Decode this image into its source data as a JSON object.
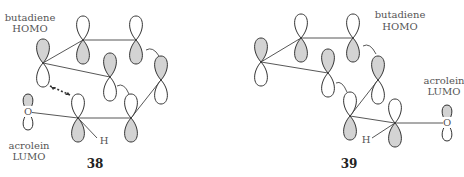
{
  "colors": {
    "shaded": "#d3d3d3",
    "white": "#ffffff",
    "line": "#444444"
  },
  "diagram_38": {
    "number": "38",
    "label_homo_line1": "butadiene",
    "label_homo_line2": "HOMO",
    "label_lumo_line1": "acrolein",
    "label_lumo_line2": "LUMO",
    "oxygen_label": "O",
    "hydrogen_label": "H"
  },
  "diagram_39": {
    "number": "39",
    "label_homo_line1": "butadiene",
    "label_homo_line2": "HOMO",
    "label_lumo_line1": "acrolein",
    "label_lumo_line2": "LUMO",
    "oxygen_label": "O",
    "hydrogen_label": "H"
  }
}
